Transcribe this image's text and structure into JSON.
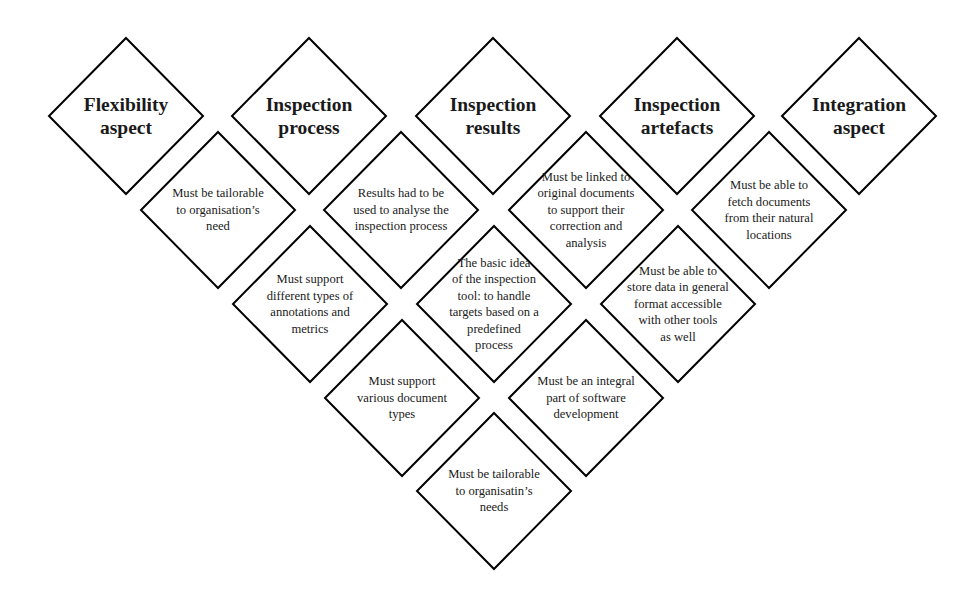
{
  "diagram": {
    "stroke_color": "#000000",
    "fill_color": "#ffffff",
    "headers": [
      {
        "id": "flexibility",
        "label": "Flexibility\naspect",
        "cx": 126,
        "cy": 116
      },
      {
        "id": "inspection-process",
        "label": "Inspection\nprocess",
        "cx": 309,
        "cy": 116
      },
      {
        "id": "inspection-results",
        "label": "Inspection\nresults",
        "cx": 493,
        "cy": 116
      },
      {
        "id": "inspection-artefacts",
        "label": "Inspection\nartefacts",
        "cx": 677,
        "cy": 116
      },
      {
        "id": "integration",
        "label": "Integration\naspect",
        "cx": 859,
        "cy": 116
      }
    ],
    "requirements": [
      {
        "id": "tailorable-organisation-need",
        "label": "Must be tailorable\nto organisation’s\nneed",
        "cx": 218,
        "cy": 210
      },
      {
        "id": "results-analyse-process",
        "label": "Results had to be\nused to analyse the\ninspection process",
        "cx": 401,
        "cy": 210
      },
      {
        "id": "linked-original-documents",
        "label": "Must be linked to\noriginal documents\nto support their\ncorrection and\nanalysis",
        "cx": 586,
        "cy": 210
      },
      {
        "id": "fetch-documents",
        "label": "Must be able to\nfetch documents\nfrom their natural\nlocations",
        "cx": 769,
        "cy": 210
      },
      {
        "id": "annotations-metrics",
        "label": "Must support\ndifferent types of\nannotations and\nmetrics",
        "cx": 310,
        "cy": 304
      },
      {
        "id": "basic-idea",
        "label": "The basic idea\nof the inspection\ntool: to handle\ntargets based on a\npredefined\nprocess",
        "cx": 494,
        "cy": 304
      },
      {
        "id": "store-data-general-format",
        "label": "Must be able to\nstore data in general\nformat accessible\nwith other tools\nas well",
        "cx": 678,
        "cy": 304
      },
      {
        "id": "various-document-types",
        "label": "Must support\nvarious document\ntypes",
        "cx": 402,
        "cy": 398
      },
      {
        "id": "integral-part-development",
        "label": "Must be an integral\npart of software\ndevelopment",
        "cx": 586,
        "cy": 398
      },
      {
        "id": "tailorable-organisatin-needs",
        "label": "Must be tailorable\nto organisatin’s\nneeds",
        "cx": 494,
        "cy": 491
      }
    ]
  }
}
